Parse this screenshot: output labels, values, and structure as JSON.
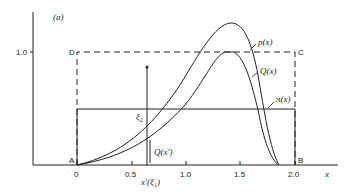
{
  "figure": {
    "panel_label": "(a)",
    "x_axis_label": "x",
    "y_tick_label": "1.0",
    "x_ticks": [
      "0",
      "0.5",
      "1.0",
      "1.5",
      "2.0"
    ],
    "corners": {
      "A": "A",
      "B": "B",
      "C": "C",
      "D": "D"
    },
    "curve_labels": {
      "p": "p(x)",
      "Q": "Q(x)",
      "pi": "π(x)"
    },
    "annotations": {
      "xi2": "ξ₂",
      "Qxprime": "Q(x′)",
      "xprime": "x′(ξ₁)"
    },
    "colors": {
      "ink": "#222222",
      "background": "#ffffff"
    }
  }
}
